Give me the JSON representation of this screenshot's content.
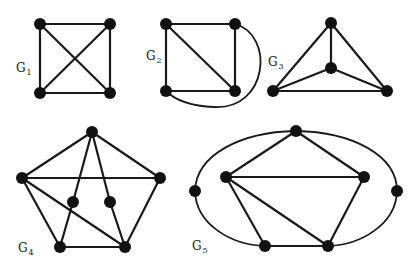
{
  "figure": {
    "title": "",
    "colors": {
      "edge": "#1a1a1a",
      "node": "#111111",
      "background": "#ffffff"
    },
    "graphs": [
      {
        "id": "G1",
        "label": "G",
        "subscript": "1",
        "label_pos": [
          16,
          72
        ],
        "nodes": [
          [
            40,
            24
          ],
          [
            110,
            24
          ],
          [
            40,
            93
          ],
          [
            110,
            93
          ]
        ],
        "edges": [
          [
            0,
            1
          ],
          [
            1,
            3
          ],
          [
            3,
            2
          ],
          [
            2,
            0
          ],
          [
            0,
            3
          ],
          [
            1,
            2
          ]
        ],
        "arcs": []
      },
      {
        "id": "G2",
        "label": "G",
        "subscript": "2",
        "label_pos": [
          146,
          60
        ],
        "nodes": [
          [
            166,
            24
          ],
          [
            235,
            24
          ],
          [
            166,
            91
          ],
          [
            235,
            91
          ]
        ],
        "edges": [
          [
            0,
            1
          ],
          [
            1,
            3
          ],
          [
            3,
            2
          ],
          [
            2,
            0
          ],
          [
            0,
            3
          ]
        ],
        "arcs": [
          {
            "from": 1,
            "to": 2,
            "path": "M235 24 C 275 35, 268 110, 214 107 C 190 106, 175 100, 166 91"
          }
        ]
      },
      {
        "id": "G3",
        "label": "G",
        "subscript": "3",
        "label_pos": [
          268,
          66
        ],
        "nodes": [
          [
            331,
            23
          ],
          [
            331,
            68
          ],
          [
            273,
            91
          ],
          [
            387,
            91
          ]
        ],
        "edges": [
          [
            0,
            2
          ],
          [
            0,
            3
          ],
          [
            2,
            3
          ],
          [
            1,
            0
          ],
          [
            1,
            2
          ],
          [
            1,
            3
          ]
        ],
        "arcs": []
      },
      {
        "id": "G4",
        "label": "G",
        "subscript": "4",
        "label_pos": [
          18,
          252
        ],
        "nodes": [
          [
            92,
            132
          ],
          [
            22,
            178
          ],
          [
            160,
            178
          ],
          [
            73,
            202
          ],
          [
            110,
            202
          ],
          [
            60,
            247
          ],
          [
            125,
            247
          ]
        ],
        "edges": [
          [
            0,
            1
          ],
          [
            0,
            2
          ],
          [
            1,
            2
          ],
          [
            0,
            3
          ],
          [
            0,
            4
          ],
          [
            1,
            5
          ],
          [
            1,
            6
          ],
          [
            2,
            6
          ],
          [
            3,
            5
          ],
          [
            4,
            6
          ],
          [
            5,
            6
          ]
        ],
        "arcs": []
      },
      {
        "id": "G5",
        "label": "G",
        "subscript": "5",
        "label_pos": [
          192,
          250
        ],
        "nodes": [
          [
            296,
            131
          ],
          [
            226,
            177
          ],
          [
            364,
            177
          ],
          [
            195,
            191
          ],
          [
            397,
            191
          ],
          [
            265,
            246
          ],
          [
            328,
            246
          ]
        ],
        "edges": [
          [
            0,
            1
          ],
          [
            0,
            2
          ],
          [
            1,
            2
          ],
          [
            1,
            5
          ],
          [
            1,
            6
          ],
          [
            2,
            6
          ],
          [
            5,
            6
          ]
        ],
        "arcs": [
          {
            "from": 0,
            "to": 3,
            "path": "M296 131 C 240 132, 196 155, 195 191"
          },
          {
            "from": 0,
            "to": 4,
            "path": "M296 131 C 352 132, 397 155, 397 191"
          },
          {
            "from": 3,
            "to": 5,
            "path": "M195 191 C 196 225, 232 245, 265 246"
          },
          {
            "from": 4,
            "to": 6,
            "path": "M397 191 C 396 225, 360 245, 328 246"
          }
        ]
      }
    ]
  }
}
